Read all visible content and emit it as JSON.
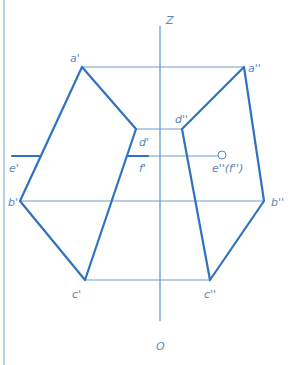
{
  "diagram": {
    "type": "orthographic-projection",
    "axis": {
      "top_label": "Z",
      "bottom_label": "O"
    },
    "labels": {
      "a1": "a'",
      "a2": "a''",
      "b1": "b'",
      "b2": "b''",
      "c1": "c'",
      "c2": "c''",
      "d1": "d'",
      "d2": "d''",
      "e1": "e'",
      "f1": "f'",
      "ef2": "e''(f'')"
    },
    "colors": {
      "thick_line": "#2f72c0",
      "thin_line": "#6b9bd3",
      "label": "#5a86bf",
      "border": "#9fbfe2"
    }
  }
}
